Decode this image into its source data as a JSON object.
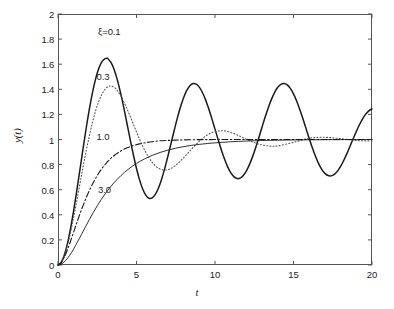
{
  "chart_data": {
    "type": "line",
    "title": "",
    "subtitle": "",
    "xlabel": "t",
    "ylabel": "y(t)",
    "xlim": [
      0,
      20
    ],
    "ylim": [
      0,
      2
    ],
    "xticks": [
      "0",
      "5",
      "10",
      "15",
      "20"
    ],
    "xtick_values": [
      0,
      5,
      10,
      15,
      20
    ],
    "yticks": [
      "0",
      "0.2",
      "0.4",
      "0.6",
      "0.8",
      "1",
      "1.2",
      "1.4",
      "1.6",
      "1.8",
      "2"
    ],
    "ytick_values": [
      0,
      0.2,
      0.4,
      0.6,
      0.8,
      1.0,
      1.2,
      1.4,
      1.6,
      1.8,
      2.0
    ],
    "grid": false,
    "legend_position": "inline-annotations",
    "annotations": [
      {
        "text": "ξ=0.1",
        "x": 2.55,
        "y": 1.86
      },
      {
        "text": "0.3",
        "x": 2.45,
        "y": 1.5
      },
      {
        "text": "1.0",
        "x": 2.45,
        "y": 1.02
      },
      {
        "text": "3.0",
        "x": 2.55,
        "y": 0.6
      }
    ],
    "series": [
      {
        "name": "ξ=0.1",
        "damping_ratio": 0.1,
        "style": "solid",
        "color": "#1a1a1a",
        "width": 1.5,
        "x": [
          0,
          0.2,
          0.4,
          0.6,
          0.8,
          1,
          1.2,
          1.4,
          1.6,
          1.8,
          2,
          2.2,
          2.4,
          2.6,
          2.8,
          3,
          3.15,
          3.2,
          3.4,
          3.6,
          3.8,
          4,
          4.2,
          4.4,
          4.6,
          4.8,
          5,
          5.2,
          5.4,
          5.6,
          5.8,
          6,
          6.2,
          6.4,
          6.6,
          6.8,
          7,
          7.2,
          7.4,
          7.6,
          7.8,
          8,
          8.2,
          8.4,
          8.6,
          8.8,
          9,
          9.2,
          9.4,
          9.5,
          9.6,
          9.8,
          10,
          10.2,
          10.4,
          10.6,
          10.8,
          11,
          11.2,
          11.4,
          11.6,
          11.8,
          12,
          12.2,
          12.4,
          12.6,
          12.8,
          13,
          13.2,
          13.4,
          13.6,
          13.8,
          14,
          14.2,
          14.4,
          14.6,
          14.8,
          15,
          15.2,
          15.4,
          15.6,
          15.8,
          16,
          16.2,
          16.4,
          16.6,
          16.8,
          17,
          17.2,
          17.4,
          17.6,
          17.8,
          18,
          18.2,
          18.4,
          18.6,
          18.8,
          19,
          19.2,
          19.4,
          19.6,
          19.8,
          20
        ],
        "y": [
          0,
          0.0199,
          0.0779,
          0.1699,
          0.2908,
          0.4344,
          0.5938,
          0.7617,
          0.9307,
          1.0937,
          1.2441,
          1.3761,
          1.4851,
          1.5675,
          1.6212,
          1.6452,
          1.6468,
          1.6404,
          1.6077,
          1.5483,
          1.4654,
          1.3633,
          1.2474,
          1.1237,
          0.9986,
          0.8784,
          0.7692,
          0.6763,
          0.6039,
          0.5553,
          0.5322,
          0.5351,
          0.5629,
          0.6136,
          0.6839,
          0.7699,
          0.8667,
          0.9692,
          1.0721,
          1.1702,
          1.2587,
          1.3333,
          1.3908,
          1.4287,
          1.4457,
          1.4416,
          1.4172,
          1.3744,
          1.3159,
          1.2815,
          1.2453,
          1.1663,
          1.0829,
          0.9989,
          0.9186,
          0.8458,
          0.784,
          0.736,
          0.7039,
          0.6891,
          0.6921,
          0.7126,
          0.7496,
          0.8014,
          0.8655,
          0.939,
          1.0185,
          1.1003,
          1.1806,
          1.2556,
          1.3218,
          1.3762,
          1.4161,
          1.4398,
          1.4462,
          1.435,
          1.407,
          1.3634,
          1.3066,
          1.2393,
          1.1648,
          1.0867,
          1.0086,
          0.934,
          0.8663,
          0.8083,
          0.7623,
          0.7301,
          0.7126,
          0.7101,
          0.7223,
          0.748,
          0.7856,
          0.8328,
          0.8871,
          0.9457,
          1.0056,
          1.0639,
          1.1177,
          1.1644,
          1.2019,
          1.2286,
          1.2434
        ]
      },
      {
        "name": "0.3",
        "damping_ratio": 0.3,
        "style": "dotted",
        "color": "#555555",
        "width": 1.1,
        "x": [
          0,
          0.2,
          0.4,
          0.6,
          0.8,
          1,
          1.2,
          1.4,
          1.6,
          1.8,
          2,
          2.2,
          2.4,
          2.6,
          2.8,
          3,
          3.2,
          3.3,
          3.4,
          3.6,
          3.8,
          4,
          4.2,
          4.4,
          4.6,
          4.8,
          5,
          5.2,
          5.4,
          5.6,
          5.8,
          6,
          6.2,
          6.4,
          6.6,
          6.8,
          7,
          7.2,
          7.4,
          7.6,
          7.8,
          8,
          8.2,
          8.4,
          8.6,
          8.8,
          9,
          9.2,
          9.4,
          9.6,
          9.8,
          10,
          10.5,
          11,
          11.5,
          12,
          12.5,
          13,
          13.5,
          14,
          15,
          16,
          17,
          18,
          19,
          20
        ],
        "y": [
          0,
          0.0191,
          0.0729,
          0.1555,
          0.2606,
          0.3818,
          0.5131,
          0.6487,
          0.7833,
          0.9123,
          1.0317,
          1.1384,
          1.23,
          1.3049,
          1.3621,
          1.4012,
          1.4224,
          1.4261,
          1.4263,
          1.414,
          1.3869,
          1.3479,
          1.2992,
          1.2436,
          1.1836,
          1.1217,
          1.0601,
          1.0009,
          0.9457,
          0.8961,
          0.8531,
          0.8177,
          0.7903,
          0.7711,
          0.7599,
          0.7564,
          0.76,
          0.77,
          0.7854,
          0.8053,
          0.8287,
          0.8545,
          0.8816,
          0.9092,
          0.9363,
          0.9622,
          0.9862,
          1.0078,
          1.0266,
          1.0423,
          1.0547,
          1.0638,
          1.0697,
          1.0566,
          1.0313,
          1.0018,
          0.9753,
          0.9567,
          0.9481,
          0.9493,
          0.9767,
          1.01,
          1.0174,
          1.0066,
          0.9925,
          0.988
        ]
      },
      {
        "name": "1.0",
        "damping_ratio": 1.0,
        "style": "dashdot",
        "color": "#1a1a1a",
        "width": 1.1,
        "x": [
          0,
          0.2,
          0.4,
          0.6,
          0.8,
          1,
          1.2,
          1.4,
          1.6,
          1.8,
          2,
          2.2,
          2.4,
          2.6,
          2.8,
          3,
          3.2,
          3.4,
          3.6,
          3.8,
          4,
          4.4,
          4.8,
          5.2,
          5.6,
          6,
          6.5,
          7,
          7.5,
          8,
          9,
          10,
          11,
          12,
          13,
          14,
          15,
          16,
          17,
          18,
          19,
          20
        ],
        "y": [
          0,
          0.0175,
          0.0616,
          0.1219,
          0.1912,
          0.2642,
          0.3374,
          0.4082,
          0.4751,
          0.5372,
          0.594,
          0.6454,
          0.6916,
          0.7326,
          0.7689,
          0.8009,
          0.8288,
          0.8532,
          0.8743,
          0.8926,
          0.9084,
          0.9335,
          0.9518,
          0.9652,
          0.9749,
          0.9826,
          0.9898,
          0.9927,
          0.9953,
          0.997,
          0.9988,
          0.9995,
          0.9998,
          0.9999,
          1.0,
          1.0,
          1.0,
          1.0,
          1.0,
          1.0,
          1.0,
          1.0
        ]
      },
      {
        "name": "3.0",
        "damping_ratio": 3.0,
        "style": "solid",
        "color": "#1a1a1a",
        "width": 0.9,
        "x": [
          0,
          0.25,
          0.5,
          0.75,
          1,
          1.5,
          2,
          2.5,
          3,
          3.5,
          4,
          4.5,
          5,
          5.5,
          6,
          6.5,
          7,
          7.5,
          8,
          8.5,
          9,
          9.5,
          10,
          10.5,
          11,
          11.5,
          12,
          12.5,
          13,
          13.5,
          14,
          14.5,
          15,
          15.5,
          16,
          16.5,
          17,
          17.5,
          18,
          18.5,
          19,
          19.5,
          20
        ],
        "y": [
          0,
          0.0099,
          0.0372,
          0.0781,
          0.1286,
          0.2443,
          0.3628,
          0.4718,
          0.5664,
          0.6459,
          0.7116,
          0.7653,
          0.809,
          0.8445,
          0.8733,
          0.8966,
          0.9155,
          0.9308,
          0.9432,
          0.9532,
          0.9613,
          0.9679,
          0.9733,
          0.9776,
          0.9818,
          0.9852,
          0.9879,
          0.9901,
          0.9919,
          0.9934,
          0.9946,
          0.9956,
          0.9964,
          0.9971,
          0.9976,
          0.998,
          0.9984,
          0.9987,
          0.9989,
          0.9991,
          0.9993,
          0.9994,
          0.9995
        ]
      }
    ],
    "axis_color": "#555555",
    "background_color": "#ffffff"
  }
}
